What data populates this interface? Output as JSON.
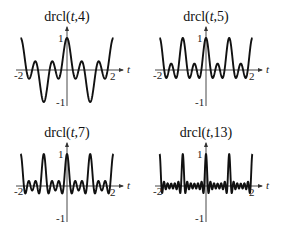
{
  "chart_data": [
    {
      "type": "line",
      "title": "drcl(t,4)",
      "title_parts": {
        "fn": "drcl(",
        "var": "t",
        "rest": ",4)"
      },
      "function": "sin(pi*N*t)/(N*sin(pi*t))",
      "N": 4,
      "x_range": [
        -2,
        2
      ],
      "ylim": [
        -1,
        1
      ],
      "xlabel": "t",
      "x_ticks": [
        "-2",
        "2"
      ],
      "y_ticks": [
        "1",
        "-1"
      ],
      "grid": false
    },
    {
      "type": "line",
      "title": "drcl(t,5)",
      "title_parts": {
        "fn": "drcl(",
        "var": "t",
        "rest": ",5)"
      },
      "function": "sin(pi*N*t)/(N*sin(pi*t))",
      "N": 5,
      "x_range": [
        -2,
        2
      ],
      "ylim": [
        -1,
        1
      ],
      "xlabel": "t",
      "x_ticks": [
        "-2",
        "2"
      ],
      "y_ticks": [
        "1",
        "-1"
      ],
      "grid": false
    },
    {
      "type": "line",
      "title": "drcl(t,7)",
      "title_parts": {
        "fn": "drcl(",
        "var": "t",
        "rest": ",7)"
      },
      "function": "sin(pi*N*t)/(N*sin(pi*t))",
      "N": 7,
      "x_range": [
        -2,
        2
      ],
      "ylim": [
        -1,
        1
      ],
      "xlabel": "t",
      "x_ticks": [
        "-2",
        "2"
      ],
      "y_ticks": [
        "1",
        "-1"
      ],
      "grid": false
    },
    {
      "type": "line",
      "title": "drcl(t,13)",
      "title_parts": {
        "fn": "drcl(",
        "var": "t",
        "rest": ",13)"
      },
      "function": "sin(pi*N*t)/(N*sin(pi*t))",
      "N": 13,
      "x_range": [
        -2,
        2
      ],
      "ylim": [
        -1,
        1
      ],
      "xlabel": "t",
      "x_ticks": [
        "-2",
        "2"
      ],
      "y_ticks": [
        "1",
        "-1"
      ],
      "grid": false
    }
  ]
}
